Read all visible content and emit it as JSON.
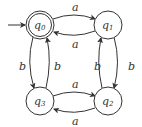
{
  "diagram": {
    "type": "finite-automaton",
    "initial_state": "q0",
    "accepting_states": [
      "q0"
    ],
    "states": [
      {
        "id": "q0",
        "label": "q",
        "sub": "0",
        "x": 40,
        "y": 24,
        "accepting": true
      },
      {
        "id": "q1",
        "label": "q",
        "sub": "1",
        "x": 108,
        "y": 24,
        "accepting": false
      },
      {
        "id": "q2",
        "label": "q",
        "sub": "2",
        "x": 108,
        "y": 101,
        "accepting": false
      },
      {
        "id": "q3",
        "label": "q",
        "sub": "3",
        "x": 40,
        "y": 101,
        "accepting": false
      }
    ],
    "transitions": [
      {
        "from": "q0",
        "to": "q1",
        "symbol": "a"
      },
      {
        "from": "q1",
        "to": "q0",
        "symbol": "a"
      },
      {
        "from": "q1",
        "to": "q2",
        "symbol": "b"
      },
      {
        "from": "q2",
        "to": "q1",
        "symbol": "b"
      },
      {
        "from": "q3",
        "to": "q2",
        "symbol": "a"
      },
      {
        "from": "q2",
        "to": "q3",
        "symbol": "a"
      },
      {
        "from": "q0",
        "to": "q3",
        "symbol": "b"
      },
      {
        "from": "q3",
        "to": "q0",
        "symbol": "b"
      }
    ],
    "labels": {
      "a_top": "a",
      "a_mid_top": "a",
      "a_mid_bottom": "a",
      "a_bottom": "a",
      "b_left_out": "b",
      "b_left_in": "b",
      "b_right_out": "b",
      "b_right_in": "b",
      "q0": "q",
      "q0_sub": "0",
      "q1": "q",
      "q1_sub": "1",
      "q2": "q",
      "q2_sub": "2",
      "q3": "q",
      "q3_sub": "3"
    }
  }
}
